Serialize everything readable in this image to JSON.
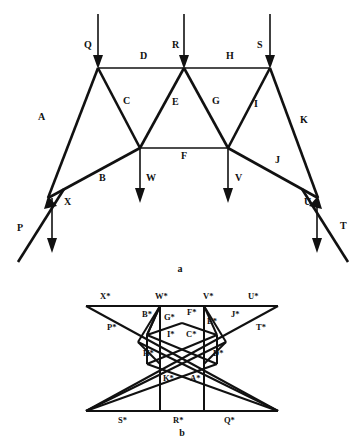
{
  "figure": {
    "ink_color": "#111111",
    "background_color": "#ffffff",
    "panels": [
      {
        "id": "a",
        "caption": "a",
        "role": "space-diagram-truss"
      },
      {
        "id": "b",
        "caption": "b",
        "role": "reciprocal-force-diagram"
      }
    ]
  },
  "panel_a": {
    "caption": "a",
    "applied_load_labels": [
      {
        "name": "Q",
        "text": "Q",
        "x": 84,
        "y": 48
      },
      {
        "name": "R",
        "text": "R",
        "x": 172,
        "y": 48
      },
      {
        "name": "S",
        "text": "S",
        "x": 257,
        "y": 48
      },
      {
        "name": "W",
        "text": "W",
        "x": 146,
        "y": 181
      },
      {
        "name": "V",
        "text": "V",
        "x": 235,
        "y": 181
      },
      {
        "name": "X",
        "text": "X",
        "x": 64,
        "y": 205
      },
      {
        "name": "U",
        "text": "U",
        "x": 304,
        "y": 205
      },
      {
        "name": "P",
        "text": "P",
        "x": 17,
        "y": 231
      },
      {
        "name": "T",
        "text": "T",
        "x": 340,
        "y": 229
      }
    ],
    "member_labels": [
      {
        "name": "A",
        "text": "A",
        "x": 38,
        "y": 120
      },
      {
        "name": "B",
        "text": "B",
        "x": 99,
        "y": 181
      },
      {
        "name": "C",
        "text": "C",
        "x": 123,
        "y": 104
      },
      {
        "name": "D",
        "text": "D",
        "x": 140,
        "y": 59
      },
      {
        "name": "E",
        "text": "E",
        "x": 172,
        "y": 105
      },
      {
        "name": "F",
        "text": "F",
        "x": 181,
        "y": 157
      },
      {
        "name": "G",
        "text": "G",
        "x": 212,
        "y": 104
      },
      {
        "name": "H",
        "text": "H",
        "x": 226,
        "y": 59
      },
      {
        "name": "I",
        "text": "I",
        "x": 254,
        "y": 107
      },
      {
        "name": "J",
        "text": "J",
        "x": 275,
        "y": 163
      },
      {
        "name": "K",
        "text": "K",
        "x": 300,
        "y": 123
      }
    ]
  },
  "panel_b": {
    "caption": "b",
    "point_labels": [
      {
        "name": "X-star",
        "text": "X*",
        "x": 100,
        "y": 299
      },
      {
        "name": "W-star",
        "text": "W*",
        "x": 155,
        "y": 299
      },
      {
        "name": "V-star",
        "text": "V*",
        "x": 203,
        "y": 299
      },
      {
        "name": "U-star",
        "text": "U*",
        "x": 248,
        "y": 299
      },
      {
        "name": "B-star",
        "text": "B*",
        "x": 142,
        "y": 317
      },
      {
        "name": "G-star",
        "text": "G*",
        "x": 164,
        "y": 320
      },
      {
        "name": "F-star",
        "text": "F*",
        "x": 187,
        "y": 315
      },
      {
        "name": "E-star",
        "text": "E*",
        "x": 204,
        "y": 324
      },
      {
        "name": "J-star",
        "text": "J*",
        "x": 231,
        "y": 317
      },
      {
        "name": "P-star",
        "text": "P*",
        "x": 110,
        "y": 330
      },
      {
        "name": "T-star",
        "text": "T*",
        "x": 256,
        "y": 330
      },
      {
        "name": "I-star",
        "text": "I*",
        "x": 172,
        "y": 337
      },
      {
        "name": "C-star",
        "text": "C*",
        "x": 189,
        "y": 337
      },
      {
        "name": "H-star",
        "text": "H*",
        "x": 148,
        "y": 356
      },
      {
        "name": "D-star",
        "text": "D*",
        "x": 216,
        "y": 356
      },
      {
        "name": "K-star",
        "text": "K*",
        "x": 167,
        "y": 381
      },
      {
        "name": "A-star",
        "text": "A*",
        "x": 192,
        "y": 381
      },
      {
        "name": "S-star",
        "text": "S*",
        "x": 124,
        "y": 404
      },
      {
        "name": "R-star",
        "text": "R*",
        "x": 178,
        "y": 404
      },
      {
        "name": "Q-star",
        "text": "Q*",
        "x": 229,
        "y": 404
      }
    ]
  }
}
